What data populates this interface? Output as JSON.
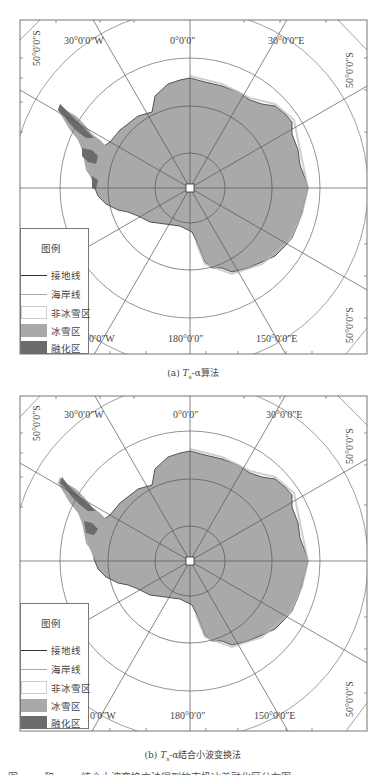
{
  "figure_a": {
    "caption_prefix": "(a) ",
    "caption_var": "T",
    "caption_sub": "s",
    "caption_suffix": "-α算法",
    "labels": {
      "lon_30w": "30°0′0″W",
      "lon_0": "0°0′0″",
      "lon_30e": "30°0′0″E",
      "lat_50s_left": "50°0′0″S",
      "lat_50s_right": "50°0′0″S",
      "lat_50s_bottom_right": "50°0′0″S",
      "lon_150w": "0′0″W",
      "lon_180": "180°0′0″",
      "lon_150e": "150°0′0″E"
    },
    "legend": {
      "title": "图例",
      "items": [
        {
          "label": "接地线",
          "type": "line",
          "color": "#333333"
        },
        {
          "label": "海岸线",
          "type": "line",
          "color": "#aaaaaa"
        },
        {
          "label": "非冰雪区",
          "type": "box",
          "color": "#ffffff"
        },
        {
          "label": "冰雪区",
          "type": "box",
          "color": "#a9a9a9"
        },
        {
          "label": "融化区",
          "type": "box",
          "color": "#6b6b6b"
        }
      ]
    }
  },
  "figure_b": {
    "caption_prefix": "(b) ",
    "caption_var": "T",
    "caption_sub": "s",
    "caption_suffix": "-α结合小波变换法",
    "labels": {
      "lon_30w": "30°0′0″W",
      "lon_0": "0°0′0″",
      "lon_30e": "30°0′0″E",
      "lat_50s_left": "50°0′0″S",
      "lat_50s_right": "50°0′0″S",
      "lat_50s_bottom_right": "50°0′0″S",
      "lon_150w": "0′0″W",
      "lon_180": "180°0′0″",
      "lon_150e": "150°0′0″E"
    },
    "legend": {
      "title": "图例",
      "items": [
        {
          "label": "接地线",
          "type": "line",
          "color": "#333333"
        },
        {
          "label": "海岸线",
          "type": "line",
          "color": "#aaaaaa"
        },
        {
          "label": "非冰雪区",
          "type": "box",
          "color": "#ffffff"
        },
        {
          "label": "冰雪区",
          "type": "box",
          "color": "#a9a9a9"
        },
        {
          "label": "融化区",
          "type": "box",
          "color": "#6b6b6b"
        }
      ]
    }
  },
  "colors": {
    "ice": "#a9a9a9",
    "melt": "#6b6b6b",
    "grid": "#666666",
    "frame": "#777777"
  },
  "truncated_caption": "图 …… 和 …… 结合小波变换方法得到的南极冰盖融化区分布图"
}
